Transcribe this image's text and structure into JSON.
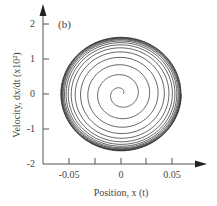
{
  "chart_data": {
    "type": "line",
    "subtype": "phase-portrait-spiral",
    "panel_label": "(b)",
    "title": "",
    "xlabel": "Position, x (t)",
    "ylabel": "Velocity, dx/dt (x10²)",
    "xlim": [
      -0.075,
      0.075
    ],
    "ylim": [
      -2,
      2.2
    ],
    "x_ticks": [
      -0.05,
      -0.025,
      0,
      0.025,
      0.05
    ],
    "x_tick_labels": [
      "-0.05",
      "",
      "0",
      "",
      "0.05"
    ],
    "y_ticks": [
      -2,
      -1,
      0,
      1,
      2
    ],
    "y_tick_labels": [
      "-2",
      "-1",
      "0",
      "1",
      "2"
    ],
    "grid": false,
    "legend": null,
    "series": [
      {
        "name": "trajectory",
        "description": "Spiral outward from origin converging to a limit cycle",
        "center": [
          0,
          0
        ],
        "limit_cycle_x_amplitude": 0.06,
        "limit_cycle_y_amplitude": 1.65,
        "approx_turns": 14
      }
    ]
  }
}
